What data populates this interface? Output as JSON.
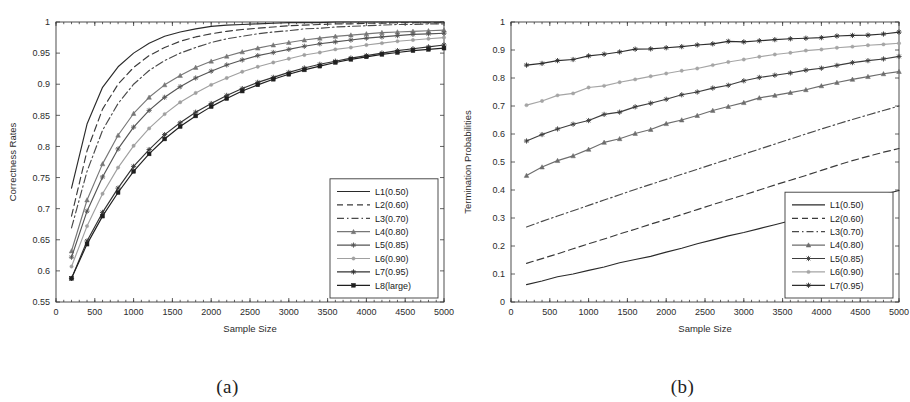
{
  "figure": {
    "caption_a": "(a)",
    "caption_b": "(b)"
  },
  "chart_data": [
    {
      "id": "panel-a",
      "type": "line",
      "title": "",
      "xlabel": "Sample Size",
      "ylabel": "Correctness Rates",
      "xlim": [
        0,
        5000
      ],
      "ylim": [
        0.55,
        1.0
      ],
      "xticks": [
        0,
        500,
        1000,
        1500,
        2000,
        2500,
        3000,
        3500,
        4000,
        4500,
        5000
      ],
      "xticklabels": [
        "0",
        "500",
        "1000",
        "1500",
        "2000",
        "2500",
        "3000",
        "3500",
        "4000",
        "4500",
        "5000"
      ],
      "yticks": [
        0.55,
        0.6,
        0.65,
        0.7,
        0.75,
        0.8,
        0.85,
        0.9,
        0.95,
        1
      ],
      "yticklabels": [
        "0.55",
        "0.6",
        "0.65",
        "0.7",
        "0.75",
        "0.8",
        "0.85",
        "0.9",
        "0.95",
        "1"
      ],
      "grid": false,
      "legend_position": "lower-right",
      "x": [
        200,
        400,
        600,
        800,
        1000,
        1200,
        1400,
        1600,
        1800,
        2000,
        2200,
        2400,
        2600,
        2800,
        3000,
        3200,
        3400,
        3600,
        3800,
        4000,
        4200,
        4400,
        4600,
        4800,
        5000
      ],
      "series": [
        {
          "name": "L1(0.50)",
          "style": "solid",
          "marker": "none",
          "color": "#2a2a2a",
          "values": [
            0.733,
            0.836,
            0.895,
            0.928,
            0.95,
            0.966,
            0.977,
            0.984,
            0.989,
            0.993,
            0.995,
            0.996,
            0.997,
            0.998,
            0.999,
            0.999,
            0.999,
            1.0,
            1.0,
            1.0,
            1.0,
            1.0,
            1.0,
            1.0,
            1.0
          ]
        },
        {
          "name": "L2(0.60)",
          "style": "dashed",
          "marker": "none",
          "color": "#3a3a3a",
          "values": [
            0.688,
            0.793,
            0.86,
            0.9,
            0.927,
            0.946,
            0.959,
            0.969,
            0.976,
            0.981,
            0.985,
            0.988,
            0.99,
            0.992,
            0.994,
            0.995,
            0.996,
            0.997,
            0.997,
            0.998,
            0.998,
            0.999,
            0.999,
            0.999,
            0.999
          ]
        },
        {
          "name": "L3(0.70)",
          "style": "dashdot",
          "marker": "none",
          "color": "#4a4a4a",
          "values": [
            0.669,
            0.76,
            0.826,
            0.869,
            0.9,
            0.922,
            0.938,
            0.95,
            0.959,
            0.967,
            0.973,
            0.977,
            0.981,
            0.984,
            0.986,
            0.989,
            0.99,
            0.992,
            0.993,
            0.994,
            0.995,
            0.996,
            0.996,
            0.997,
            0.997
          ]
        },
        {
          "name": "L4(0.80)",
          "style": "solid",
          "marker": "triangle",
          "color": "#777777",
          "values": [
            0.632,
            0.714,
            0.772,
            0.818,
            0.853,
            0.879,
            0.899,
            0.914,
            0.927,
            0.937,
            0.945,
            0.952,
            0.958,
            0.963,
            0.967,
            0.971,
            0.974,
            0.977,
            0.979,
            0.981,
            0.983,
            0.984,
            0.985,
            0.986,
            0.987
          ]
        },
        {
          "name": "L5(0.85)",
          "style": "solid",
          "marker": "star",
          "color": "#555555",
          "values": [
            0.622,
            0.696,
            0.751,
            0.796,
            0.831,
            0.858,
            0.879,
            0.896,
            0.91,
            0.921,
            0.931,
            0.939,
            0.946,
            0.951,
            0.956,
            0.961,
            0.965,
            0.968,
            0.971,
            0.974,
            0.976,
            0.978,
            0.98,
            0.981,
            0.982
          ]
        },
        {
          "name": "L6(0.90)",
          "style": "solid",
          "marker": "dot",
          "color": "#a0a0a0",
          "values": [
            0.607,
            0.672,
            0.724,
            0.766,
            0.801,
            0.829,
            0.852,
            0.871,
            0.886,
            0.899,
            0.91,
            0.92,
            0.928,
            0.935,
            0.941,
            0.947,
            0.951,
            0.956,
            0.959,
            0.963,
            0.966,
            0.969,
            0.971,
            0.973,
            0.975
          ]
        },
        {
          "name": "L7(0.95)",
          "style": "solid",
          "marker": "star",
          "color": "#333333",
          "values": [
            0.588,
            0.648,
            0.694,
            0.733,
            0.768,
            0.795,
            0.819,
            0.838,
            0.855,
            0.869,
            0.882,
            0.893,
            0.903,
            0.911,
            0.919,
            0.926,
            0.932,
            0.937,
            0.942,
            0.946,
            0.95,
            0.954,
            0.957,
            0.96,
            0.963
          ]
        },
        {
          "name": "L8(large)",
          "style": "solid",
          "marker": "square",
          "color": "#1f1f1f",
          "values": [
            0.588,
            0.643,
            0.688,
            0.726,
            0.76,
            0.788,
            0.812,
            0.832,
            0.849,
            0.864,
            0.877,
            0.889,
            0.899,
            0.908,
            0.916,
            0.923,
            0.929,
            0.935,
            0.94,
            0.944,
            0.948,
            0.951,
            0.954,
            0.956,
            0.958
          ]
        }
      ]
    },
    {
      "id": "panel-b",
      "type": "line",
      "title": "",
      "xlabel": "Sample Size",
      "ylabel": "Termination Probabilities",
      "xlim": [
        0,
        5000
      ],
      "ylim": [
        0,
        1.0
      ],
      "xticks": [
        0,
        500,
        1000,
        1500,
        2000,
        2500,
        3000,
        3500,
        4000,
        4500,
        5000
      ],
      "xticklabels": [
        "0",
        "500",
        "1000",
        "1500",
        "2000",
        "2500",
        "3000",
        "3500",
        "4000",
        "4500",
        "5000"
      ],
      "yticks": [
        0,
        0.1,
        0.2,
        0.3,
        0.4,
        0.5,
        0.6,
        0.7,
        0.8,
        0.9,
        1
      ],
      "yticklabels": [
        "0",
        "0.1",
        "0.2",
        "0.3",
        "0.4",
        "0.5",
        "0.6",
        "0.7",
        "0.8",
        "0.9",
        "1"
      ],
      "grid": false,
      "legend_position": "lower-right",
      "x": [
        200,
        400,
        600,
        800,
        1000,
        1200,
        1400,
        1600,
        1800,
        2000,
        2200,
        2400,
        2600,
        2800,
        3000,
        3200,
        3400,
        3600,
        3800,
        4000,
        4200,
        4400,
        4600,
        4800,
        5000
      ],
      "series": [
        {
          "name": "L1(0.50)",
          "style": "solid",
          "marker": "none",
          "color": "#2a2a2a",
          "values": [
            0.062,
            0.075,
            0.09,
            0.1,
            0.113,
            0.125,
            0.14,
            0.152,
            0.163,
            0.178,
            0.192,
            0.208,
            0.222,
            0.236,
            0.248,
            0.262,
            0.276,
            0.29,
            0.305,
            0.32,
            0.338,
            0.352,
            0.368,
            0.384,
            0.398
          ]
        },
        {
          "name": "L2(0.60)",
          "style": "dashed",
          "marker": "none",
          "color": "#3a3a3a",
          "values": [
            0.138,
            0.155,
            0.172,
            0.19,
            0.208,
            0.225,
            0.243,
            0.26,
            0.278,
            0.295,
            0.312,
            0.33,
            0.348,
            0.365,
            0.382,
            0.4,
            0.418,
            0.435,
            0.452,
            0.47,
            0.488,
            0.505,
            0.52,
            0.535,
            0.548
          ]
        },
        {
          "name": "L3(0.70)",
          "style": "dashdot",
          "marker": "none",
          "color": "#4a4a4a",
          "values": [
            0.268,
            0.288,
            0.307,
            0.326,
            0.345,
            0.364,
            0.383,
            0.402,
            0.42,
            0.438,
            0.456,
            0.474,
            0.492,
            0.51,
            0.528,
            0.546,
            0.564,
            0.582,
            0.6,
            0.618,
            0.635,
            0.652,
            0.668,
            0.684,
            0.7
          ]
        },
        {
          "name": "L4(0.80)",
          "style": "solid",
          "marker": "triangle",
          "color": "#6d6d6d",
          "values": [
            0.452,
            0.482,
            0.505,
            0.522,
            0.545,
            0.57,
            0.583,
            0.602,
            0.616,
            0.637,
            0.65,
            0.666,
            0.684,
            0.698,
            0.712,
            0.729,
            0.738,
            0.748,
            0.758,
            0.772,
            0.784,
            0.795,
            0.805,
            0.815,
            0.823
          ]
        },
        {
          "name": "L5(0.85)",
          "style": "solid",
          "marker": "star",
          "color": "#3d3d3d",
          "values": [
            0.575,
            0.598,
            0.618,
            0.635,
            0.648,
            0.67,
            0.678,
            0.697,
            0.71,
            0.724,
            0.74,
            0.75,
            0.764,
            0.774,
            0.79,
            0.802,
            0.81,
            0.818,
            0.828,
            0.835,
            0.845,
            0.855,
            0.862,
            0.868,
            0.877
          ]
        },
        {
          "name": "L6(0.90)",
          "style": "solid",
          "marker": "dot",
          "color": "#a5a5a5",
          "values": [
            0.703,
            0.718,
            0.738,
            0.745,
            0.766,
            0.772,
            0.785,
            0.795,
            0.806,
            0.816,
            0.826,
            0.834,
            0.846,
            0.857,
            0.866,
            0.876,
            0.884,
            0.89,
            0.898,
            0.902,
            0.908,
            0.912,
            0.917,
            0.92,
            0.924
          ]
        },
        {
          "name": "L7(0.95)",
          "style": "solid",
          "marker": "star",
          "color": "#2e2e2e",
          "values": [
            0.846,
            0.852,
            0.862,
            0.866,
            0.879,
            0.885,
            0.893,
            0.903,
            0.904,
            0.908,
            0.912,
            0.918,
            0.922,
            0.931,
            0.929,
            0.933,
            0.937,
            0.94,
            0.942,
            0.944,
            0.95,
            0.952,
            0.953,
            0.957,
            0.964
          ]
        }
      ]
    }
  ]
}
